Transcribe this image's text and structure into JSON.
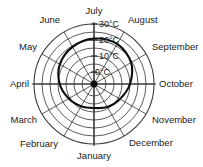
{
  "chart_data": {
    "type": "line",
    "subtype": "polar",
    "title": "",
    "xlabel": "",
    "ylabel": "",
    "categories": [
      "January",
      "February",
      "March",
      "April",
      "May",
      "June",
      "July",
      "August",
      "September",
      "October",
      "November",
      "December"
    ],
    "values": [
      9,
      10,
      12,
      15,
      18,
      20,
      21.5,
      22,
      20,
      16,
      12.5,
      10.5
    ],
    "unit": "°C",
    "radial_ticks": [
      {
        "value": 0,
        "label": "0°C"
      },
      {
        "value": 10,
        "label": "10°C"
      },
      {
        "value": 20,
        "label": "20°C"
      },
      {
        "value": 30,
        "label": "30°C"
      }
    ],
    "rlim": [
      -5,
      30
    ],
    "grid": true,
    "legend": "none",
    "angular_start": "July at top",
    "angular_direction": "clockwise"
  },
  "axis": {
    "tick_0": "0°C",
    "tick_10": "10°C",
    "tick_20": "20°C",
    "tick_30": "30°C"
  },
  "months": {
    "july": "July",
    "august": "August",
    "september": "September",
    "october": "October",
    "november": "November",
    "december": "December",
    "january": "January",
    "february": "February",
    "march": "March",
    "april": "April",
    "may": "May",
    "june": "June"
  }
}
